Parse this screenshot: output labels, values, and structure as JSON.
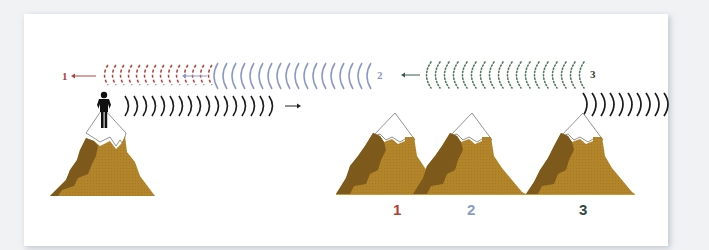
{
  "diagram": {
    "colors": {
      "background": "#f1f2f4",
      "card": "#ffffff",
      "mountain_light": "#b3852a",
      "mountain_dark": "#7d5a1c",
      "snow_outline": "#777777",
      "emitted_wave": "#1a1a1a",
      "echo_1": "#b0423a",
      "echo_2": "#8a98c6",
      "echo_3": "#4f7a5a",
      "label_1": "#b0423a",
      "label_2": "#8a9cc8",
      "label_3": "#2f4a45"
    },
    "echo_rows": [
      {
        "id": "echo-1",
        "label": "1",
        "style": "dashed",
        "direction": "left"
      },
      {
        "id": "echo-2",
        "label": "2",
        "style": "solid",
        "direction": "left"
      },
      {
        "id": "echo-3",
        "label": "3",
        "style": "dotted",
        "direction": "left"
      }
    ],
    "emitted_waves": [
      {
        "id": "shout-wave",
        "direction": "right"
      },
      {
        "id": "reflected-wave-at-mountain-3",
        "direction": "right"
      }
    ],
    "mountain_labels": [
      "1",
      "2",
      "3"
    ],
    "person": "person-on-peak"
  }
}
